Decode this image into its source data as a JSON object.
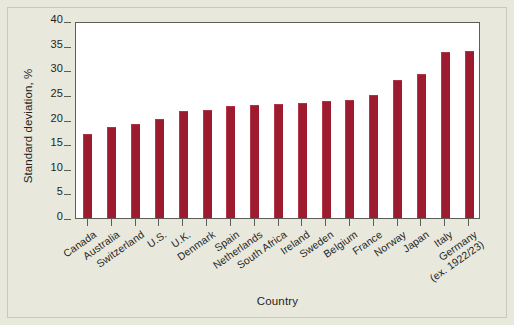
{
  "chart_data": {
    "type": "bar",
    "title": "",
    "xlabel": "Country",
    "ylabel": "Standard deviation, %",
    "ylim": [
      0,
      40
    ],
    "yticks": [
      0,
      5,
      10,
      15,
      20,
      25,
      30,
      35,
      40
    ],
    "grid": false,
    "legend": null,
    "bar_color": "#9c1b2e",
    "plot_background": "#ffffff",
    "figure_background": "#e9e8dc",
    "categories": [
      "Canada",
      "Australia",
      "Switzerland",
      "U.S.",
      "U.K.",
      "Denmark",
      "Spain",
      "Netherlands",
      "South Africa",
      "Ireland",
      "Sweden",
      "Belgium",
      "France",
      "Norway",
      "Japan",
      "Italy",
      "Germany"
    ],
    "category_notes": {
      "Germany": "(ex. 1922/23)"
    },
    "values": [
      17.0,
      18.5,
      19.1,
      20.1,
      21.8,
      22.0,
      22.8,
      23.0,
      23.2,
      23.4,
      23.8,
      24.0,
      25.0,
      28.0,
      29.2,
      33.8,
      34.0
    ]
  },
  "axis": {
    "y_title": "Standard deviation, %",
    "x_title": "Country",
    "y_tick_labels": [
      "40",
      "35",
      "30",
      "25",
      "20",
      "15",
      "10",
      "5",
      "0"
    ]
  },
  "x_labels": [
    {
      "main": "Canada",
      "sub": ""
    },
    {
      "main": "Australia",
      "sub": ""
    },
    {
      "main": "Switzerland",
      "sub": ""
    },
    {
      "main": "U.S.",
      "sub": ""
    },
    {
      "main": "U.K.",
      "sub": ""
    },
    {
      "main": "Denmark",
      "sub": ""
    },
    {
      "main": "Spain",
      "sub": ""
    },
    {
      "main": "Netherlands",
      "sub": ""
    },
    {
      "main": "South Africa",
      "sub": ""
    },
    {
      "main": "Ireland",
      "sub": ""
    },
    {
      "main": "Sweden",
      "sub": ""
    },
    {
      "main": "Belgium",
      "sub": ""
    },
    {
      "main": "France",
      "sub": ""
    },
    {
      "main": "Norway",
      "sub": ""
    },
    {
      "main": "Japan",
      "sub": ""
    },
    {
      "main": "Italy",
      "sub": ""
    },
    {
      "main": "Germany",
      "sub": "(ex. 1922/23)"
    }
  ]
}
